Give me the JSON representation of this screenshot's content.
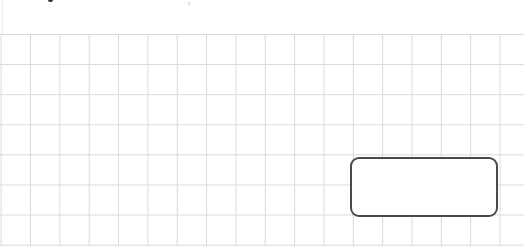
{
  "canvas": {
    "background": "#ffffff",
    "grid": {
      "line_color": "#d9d9d9",
      "cell_width_px": 29.35,
      "cell_height_px": 30.1,
      "origin_y_px": 34
    }
  },
  "shapes": [
    {
      "type": "rounded-rectangle",
      "label": "",
      "border_color": "#4a4a4a",
      "fill_color": "#ffffff",
      "x": 350,
      "y": 157,
      "width": 147,
      "height": 59
    }
  ]
}
